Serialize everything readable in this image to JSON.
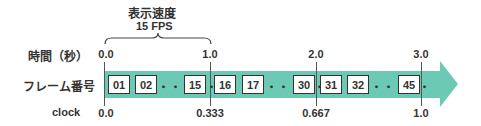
{
  "header": {
    "title": "表示速度",
    "subtitle": "15 FPS"
  },
  "rows": {
    "time_label": "時間（秒）",
    "frame_label": "フレーム番号",
    "clock_label": "clock"
  },
  "time_ticks": [
    "0.0",
    "1.0",
    "2.0",
    "3.0"
  ],
  "clock_ticks": [
    "0.0",
    "0.333",
    "0.667",
    "1.0"
  ],
  "frames": [
    "01",
    "02",
    "15",
    "16",
    "17",
    "30",
    "31",
    "32",
    "45"
  ],
  "ellipsis": "・・・・・",
  "colors": {
    "arrow": "#6ccab4",
    "text": "#333333",
    "frame_border": "#333333"
  }
}
